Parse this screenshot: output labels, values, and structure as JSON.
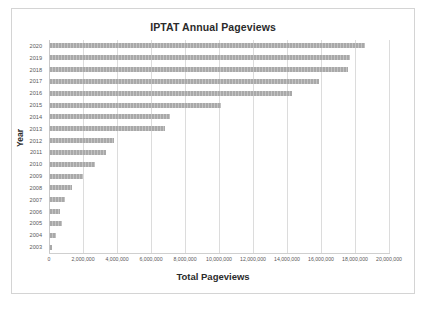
{
  "chart_data": {
    "type": "bar",
    "orientation": "horizontal",
    "title": "IPTAT Annual Pageviews",
    "xlabel": "Total Pageviews",
    "ylabel": "Year",
    "xlim": [
      0,
      20000000
    ],
    "grid": true,
    "legend": "none",
    "bar_color": "#a9a9a9",
    "gridline_color": "#dcdcdc",
    "categories": [
      "2020",
      "2019",
      "2018",
      "2017",
      "2016",
      "2015",
      "2014",
      "2013",
      "2012",
      "2011",
      "2010",
      "2009",
      "2008",
      "2007",
      "2006",
      "2005",
      "2004",
      "2003"
    ],
    "values": [
      18600000,
      17700000,
      17600000,
      15900000,
      14300000,
      10100000,
      7100000,
      6800000,
      3850000,
      3350000,
      2700000,
      2000000,
      1350000,
      950000,
      650000,
      750000,
      400000,
      200000
    ],
    "x_tick_values": [
      0,
      2000000,
      4000000,
      6000000,
      8000000,
      10000000,
      12000000,
      14000000,
      16000000,
      18000000,
      20000000
    ],
    "x_tick_labels": [
      "0",
      "2,000,000",
      "4,000,000",
      "6,000,000",
      "8,000,000",
      "10,000,000",
      "12,000,000",
      "14,000,000",
      "16,000,000",
      "18,000,000",
      "20,000,000"
    ]
  }
}
